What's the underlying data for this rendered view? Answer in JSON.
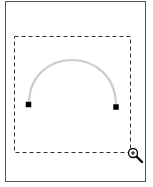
{
  "canvas": {
    "frame_color": "#555555",
    "selection": {
      "x": 14,
      "y": 36,
      "w": 116,
      "h": 116,
      "style": "dashed",
      "color": "#333333"
    },
    "arc": {
      "start": [
        29,
        105
      ],
      "end": [
        116,
        107
      ],
      "apex_y": 58,
      "color": "#cccccc"
    },
    "handles": [
      {
        "name": "arc-start-handle",
        "x": 29,
        "y": 105
      },
      {
        "name": "arc-end-handle",
        "x": 116,
        "y": 107
      }
    ],
    "cursor": {
      "icon": "zoom-in-icon",
      "glyph": "+"
    }
  }
}
